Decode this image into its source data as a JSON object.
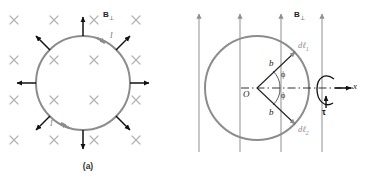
{
  "figure": {
    "title_a_caption": "(a)",
    "title_b_caption": "(b)"
  },
  "panel_a": {
    "field_label": "B",
    "field_subscript": "⊥",
    "field_symbol_name": "x-into-page-cross",
    "current_label_top": "I",
    "current_label_bottom": "I",
    "cross_marks": [
      {
        "x": 14,
        "y": 20
      },
      {
        "x": 54,
        "y": 20
      },
      {
        "x": 94,
        "y": 20
      },
      {
        "x": 136,
        "y": 20
      },
      {
        "x": 14,
        "y": 60
      },
      {
        "x": 54,
        "y": 60
      },
      {
        "x": 94,
        "y": 60
      },
      {
        "x": 136,
        "y": 60
      },
      {
        "x": 14,
        "y": 100
      },
      {
        "x": 54,
        "y": 100
      },
      {
        "x": 94,
        "y": 100
      },
      {
        "x": 136,
        "y": 100
      },
      {
        "x": 14,
        "y": 140
      },
      {
        "x": 54,
        "y": 140
      },
      {
        "x": 94,
        "y": 140
      },
      {
        "x": 136,
        "y": 140
      }
    ],
    "loop": {
      "cx": 83,
      "cy": 83,
      "r": 47,
      "color": "#8c8c8c"
    },
    "force_arrows_count": 8,
    "force_arrow_angles_deg": [
      90,
      45,
      0,
      315,
      270,
      225,
      180,
      135
    ],
    "arrow_color": "#111111"
  },
  "panel_b": {
    "field_label": "B",
    "field_subscript": "⊥",
    "field_lines": [
      14,
      55,
      96,
      137
    ],
    "field_line_color": "#8f8f8f",
    "loop": {
      "cx": 72,
      "cy": 88,
      "rx": 52,
      "ry": 52,
      "color": "#8c8c8c"
    },
    "origin_label": "O",
    "radius_label_upper": "b",
    "radius_label_lower": "b",
    "angle_label_upper": "ϕ",
    "angle_label_lower": "ϕ",
    "segment_label_upper": "dℓ",
    "segment_sub_upper": "1",
    "segment_label_lower": "dℓ",
    "segment_sub_lower": "2",
    "axis_label": "x",
    "torque_label": "τ",
    "torque_icon_name": "rotation-loop-arrow",
    "axis_style": "dash-dot"
  },
  "colors": {
    "gray_loop": "#8c8c8c",
    "gray_field": "#9a9a9a",
    "black_arrow": "#111111",
    "text": "#1a1a1a",
    "cross_mark": "#b5b5b5"
  }
}
